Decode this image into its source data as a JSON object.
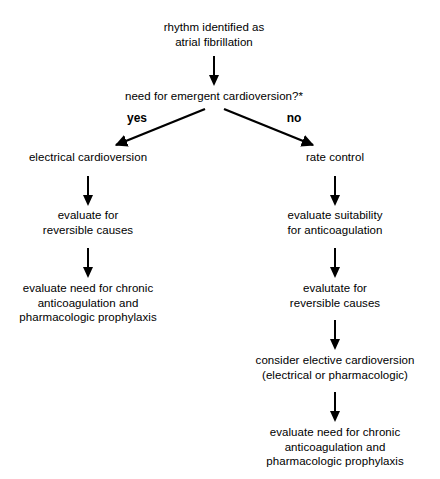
{
  "diagram": {
    "type": "flowchart",
    "background_color": "#ffffff",
    "line_color": "#000000",
    "text_color": "#000000"
  },
  "nodes": {
    "root": "rhythm identified as\natrial fibrillation",
    "decision": "need for emergent cardioversion?*",
    "left_1": "electrical cardioversion",
    "left_2": "evaluate for\nreversible causes",
    "left_3": "evaluate need for chronic\nanticoagulation and\npharmacologic prophylaxis",
    "right_1": "rate control",
    "right_2": "evaluate suitability\nfor anticoagulation",
    "right_3": "evalutate for\nreversible causes",
    "right_4": "consider elective cardioversion\n(electrical or pharmacologic)",
    "right_5": "evaluate need for chronic\nanticoagulation and\npharmacologic prophylaxis"
  },
  "branch_labels": {
    "yes": "yes",
    "no": "no"
  }
}
